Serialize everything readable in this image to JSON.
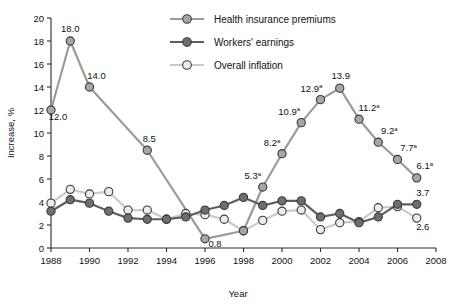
{
  "chart_data": {
    "type": "line",
    "title": "",
    "xlabel": "Year",
    "ylabel": "Increase, %",
    "xlim": [
      1988,
      2008
    ],
    "ylim": [
      0,
      20
    ],
    "xticks": [
      1988,
      1990,
      1992,
      1994,
      1996,
      1998,
      2000,
      2002,
      2004,
      2006,
      2008
    ],
    "yticks": [
      0,
      2,
      4,
      6,
      8,
      10,
      12,
      14,
      16,
      18,
      20
    ],
    "grid": false,
    "legend_position": "top-center",
    "x": [
      1988,
      1989,
      1990,
      1991,
      1992,
      1993,
      1994,
      1995,
      1996,
      1997,
      1998,
      1999,
      2000,
      2001,
      2002,
      2003,
      2004,
      2005,
      2006,
      2007
    ],
    "series": [
      {
        "name": "Health insurance premiums",
        "color": "#9b9b9b",
        "marker_fill": "#a6a6a6",
        "x": [
          1988,
          1989,
          1990,
          1993,
          1996,
          1998,
          1999,
          2000,
          2001,
          2002,
          2003,
          2004,
          2005,
          2006,
          2007
        ],
        "values": [
          12.0,
          18.0,
          14.0,
          8.5,
          0.8,
          1.5,
          5.3,
          8.2,
          10.9,
          12.9,
          13.9,
          11.2,
          9.2,
          7.7,
          6.1
        ],
        "labels": [
          {
            "x": 1988,
            "y": 12.0,
            "text": "12.0",
            "sup": "",
            "dx": 7,
            "dy": 10
          },
          {
            "x": 1989,
            "y": 18.0,
            "text": "18.0",
            "sup": "",
            "dx": 0,
            "dy": -9
          },
          {
            "x": 1990,
            "y": 14.0,
            "text": "14.0",
            "sup": "",
            "dx": 7,
            "dy": -8
          },
          {
            "x": 1993,
            "y": 8.5,
            "text": "8.5",
            "sup": "",
            "dx": 2,
            "dy": -8
          },
          {
            "x": 1996,
            "y": 0.8,
            "text": "0.8",
            "sup": "",
            "dx": 10,
            "dy": 8
          },
          {
            "x": 1999,
            "y": 5.3,
            "text": "5.3",
            "sup": "a",
            "dx": -10,
            "dy": -8
          },
          {
            "x": 2000,
            "y": 8.2,
            "text": "8.2",
            "sup": "a",
            "dx": -10,
            "dy": -8
          },
          {
            "x": 2001,
            "y": 10.9,
            "text": "10.9",
            "sup": "a",
            "dx": -12,
            "dy": -8
          },
          {
            "x": 2002,
            "y": 12.9,
            "text": "12.9",
            "sup": "a",
            "dx": -9,
            "dy": -8
          },
          {
            "x": 2003,
            "y": 13.9,
            "text": "13.9",
            "sup": "",
            "dx": 1,
            "dy": -9
          },
          {
            "x": 2004,
            "y": 11.2,
            "text": "11.2",
            "sup": "a",
            "dx": 10,
            "dy": -8
          },
          {
            "x": 2005,
            "y": 9.2,
            "text": "9.2",
            "sup": "a",
            "dx": 11,
            "dy": -8
          },
          {
            "x": 2006,
            "y": 7.7,
            "text": "7.7",
            "sup": "a",
            "dx": 11,
            "dy": -8
          },
          {
            "x": 2007,
            "y": 6.1,
            "text": "6.1",
            "sup": "a",
            "dx": 8,
            "dy": -9
          }
        ]
      },
      {
        "name": "Workers' earnings",
        "color": "#5e5e5e",
        "marker_fill": "#6e6e6e",
        "x": [
          1988,
          1989,
          1990,
          1991,
          1992,
          1993,
          1994,
          1995,
          1996,
          1997,
          1998,
          1999,
          2000,
          2001,
          2002,
          2003,
          2004,
          2005,
          2006,
          2007
        ],
        "values": [
          3.2,
          4.2,
          3.9,
          3.2,
          2.6,
          2.5,
          2.5,
          2.7,
          3.3,
          3.7,
          4.4,
          3.7,
          4.1,
          4.1,
          2.7,
          3.0,
          2.2,
          2.7,
          3.8,
          3.8
        ],
        "labels": [
          {
            "x": 2007,
            "y": 3.8,
            "text": "3.7",
            "sup": "",
            "dx": 6,
            "dy": -8
          }
        ]
      },
      {
        "name": "Overall inflation",
        "color": "#cacaca",
        "marker_fill": "#ececec",
        "x": [
          1988,
          1989,
          1990,
          1991,
          1992,
          1993,
          1994,
          1995,
          1996,
          1997,
          1998,
          1999,
          2000,
          2001,
          2002,
          2003,
          2004,
          2005,
          2006,
          2007
        ],
        "values": [
          3.9,
          5.1,
          4.7,
          4.9,
          3.3,
          3.3,
          2.5,
          3.0,
          2.9,
          2.5,
          1.5,
          2.4,
          3.2,
          3.3,
          1.6,
          2.2,
          2.3,
          3.5,
          3.6,
          2.6
        ],
        "labels": [
          {
            "x": 2007,
            "y": 2.6,
            "text": "2.6",
            "sup": "",
            "dx": 6,
            "dy": 12
          }
        ]
      }
    ],
    "legend": [
      {
        "label": "Health insurance premiums",
        "line_color": "#9b9b9b",
        "marker_fill": "#a6a6a6"
      },
      {
        "label": "Workers' earnings",
        "line_color": "#5e5e5e",
        "marker_fill": "#6e6e6e"
      },
      {
        "label": "Overall inflation",
        "line_color": "#cacaca",
        "marker_fill": "#ececec"
      }
    ],
    "marker_stroke": "#3a3a3a"
  }
}
